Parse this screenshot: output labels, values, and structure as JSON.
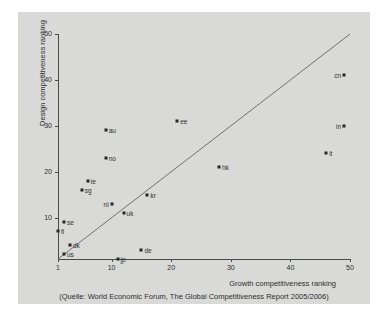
{
  "chart_data": {
    "type": "scatter",
    "title": "",
    "xlabel": "Growth competitiveness ranking",
    "ylabel": "Design competitiveness ranking",
    "source_caption": "(Quelle: World Economic Forum, The Global Competitiveness Report 2005/2006)",
    "xlim": [
      1,
      50
    ],
    "ylim": [
      1,
      50
    ],
    "xticks": [
      1,
      10,
      20,
      30,
      40,
      50
    ],
    "yticks": [
      1,
      10,
      20,
      30,
      40,
      50
    ],
    "xtick_labels": [
      "1",
      "10",
      "20",
      "30",
      "40",
      "50"
    ],
    "ytick_labels": [
      "1",
      "10",
      "20",
      "30",
      "40",
      "50"
    ],
    "grid": false,
    "legend": false,
    "reference_line": {
      "name": "diagonal-identity-line",
      "from": [
        1,
        1
      ],
      "to": [
        50,
        50
      ],
      "color": "#555555"
    },
    "points": [
      {
        "label": "fi",
        "x": 1,
        "y": 7,
        "label_side": "right"
      },
      {
        "label": "us",
        "x": 2,
        "y": 2,
        "label_side": "right"
      },
      {
        "label": "se",
        "x": 2,
        "y": 9,
        "label_side": "right"
      },
      {
        "label": "dk",
        "x": 3,
        "y": 4,
        "label_side": "right"
      },
      {
        "label": "ie",
        "x": 6,
        "y": 18,
        "label_side": "right"
      },
      {
        "label": "sg",
        "x": 5,
        "y": 16,
        "label_side": "right"
      },
      {
        "label": "no",
        "x": 9,
        "y": 23,
        "label_side": "right"
      },
      {
        "label": "au",
        "x": 9,
        "y": 29,
        "label_side": "right"
      },
      {
        "label": "nl",
        "x": 10,
        "y": 13,
        "label_side": "left"
      },
      {
        "label": "jp",
        "x": 11,
        "y": 1,
        "label_side": "right"
      },
      {
        "label": "uk",
        "x": 12,
        "y": 11,
        "label_side": "right"
      },
      {
        "label": "de",
        "x": 15,
        "y": 3,
        "label_side": "right"
      },
      {
        "label": "kr",
        "x": 16,
        "y": 15,
        "label_side": "right"
      },
      {
        "label": "ee",
        "x": 21,
        "y": 31,
        "label_side": "right"
      },
      {
        "label": "hk",
        "x": 28,
        "y": 21,
        "label_side": "right"
      },
      {
        "label": "it",
        "x": 46,
        "y": 24,
        "label_side": "right"
      },
      {
        "label": "cn",
        "x": 49,
        "y": 41,
        "label_side": "left"
      },
      {
        "label": "in",
        "x": 49,
        "y": 30,
        "label_side": "left"
      }
    ]
  },
  "colors": {
    "panel_background": "#d9d9d7",
    "page_background": "#ffffff",
    "axis": "#4a4a4a",
    "marker": "#262626",
    "text": "#2e2e2e",
    "reference_line": "#555555"
  }
}
